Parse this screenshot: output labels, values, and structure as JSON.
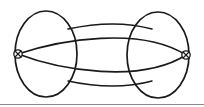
{
  "figure": {
    "title": "Two-vertex multigraph with self-loops",
    "background_color": "#ffffff",
    "stroke_color": "#1a1a1a",
    "frame_color": "#8a8a8a",
    "width": 204,
    "height": 107
  },
  "chart_data": {
    "type": "diagram",
    "title": "Two-vertex multigraph with self-loops",
    "vertices": [
      {
        "id": "v-left",
        "label": "",
        "marker": "crossed-circle",
        "x": 18,
        "y": 54,
        "radius": 4.2
      },
      {
        "id": "v-right",
        "label": "",
        "marker": "crossed-circle",
        "x": 186,
        "y": 55,
        "radius": 4.2
      }
    ],
    "edges": [
      {
        "id": "loop-left",
        "from": "v-left",
        "to": "v-left",
        "kind": "self-loop",
        "shape": "oval",
        "cx": 46,
        "cy": 54,
        "rx": 31,
        "ry": 43
      },
      {
        "id": "loop-right",
        "from": "v-right",
        "to": "v-right",
        "kind": "self-loop",
        "shape": "oval",
        "cx": 158,
        "cy": 55,
        "rx": 31,
        "ry": 43
      },
      {
        "id": "edge-top",
        "from": "v-left",
        "to": "v-right",
        "kind": "arc",
        "bow": "up"
      },
      {
        "id": "edge-bottom",
        "from": "v-left",
        "to": "v-right",
        "kind": "arc",
        "bow": "down"
      }
    ],
    "vertex_count": 2,
    "edge_count": 4,
    "legend": [],
    "xlabel": "",
    "ylabel": ""
  }
}
